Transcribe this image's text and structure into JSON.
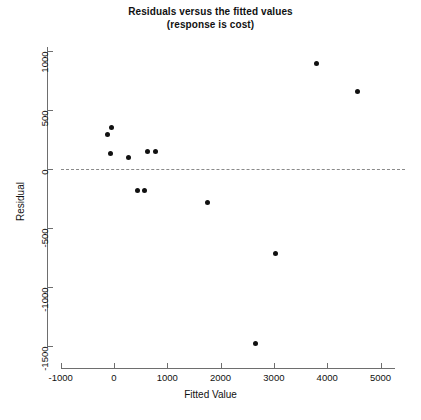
{
  "chart_data": {
    "type": "scatter",
    "title": "Residuals versus the fitted values",
    "subtitle": "(response is cost)",
    "xlabel": "Fitted Value",
    "ylabel": "Residual",
    "xlim": [
      -1000,
      5000
    ],
    "ylim": [
      -1500,
      1000
    ],
    "xticks": [
      -1000,
      0,
      1000,
      2000,
      3000,
      4000,
      5000
    ],
    "yticks": [
      1000,
      500,
      0,
      -500,
      -1000,
      -1500
    ],
    "xtick_labels": [
      "-1000",
      "0",
      "1000",
      "2000",
      "3000",
      "4000",
      "5000"
    ],
    "ytick_labels": [
      "1000",
      "500",
      "0",
      "-500",
      "-1000",
      "-1500"
    ],
    "grid": false,
    "legend": "none",
    "reference_line": {
      "type": "horizontal",
      "y": 0,
      "style": "dashed",
      "color": "#8a8a8a"
    },
    "marker": {
      "shape": "circle",
      "filled": true,
      "color": "#111111",
      "size": 5
    },
    "points": [
      {
        "x": -130,
        "y": 290
      },
      {
        "x": -55,
        "y": 350
      },
      {
        "x": -75,
        "y": 135
      },
      {
        "x": 265,
        "y": 100
      },
      {
        "x": 450,
        "y": -180
      },
      {
        "x": 565,
        "y": -180
      },
      {
        "x": 620,
        "y": 145
      },
      {
        "x": 770,
        "y": 145
      },
      {
        "x": 1745,
        "y": -280
      },
      {
        "x": 2660,
        "y": -1480
      },
      {
        "x": 3035,
        "y": -715
      },
      {
        "x": 3800,
        "y": 890
      },
      {
        "x": 4575,
        "y": 660
      }
    ]
  }
}
